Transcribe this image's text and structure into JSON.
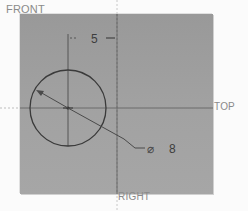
{
  "view_labels": {
    "front": "FRONT",
    "top": "TOP",
    "right": "RIGHT"
  },
  "dimensions": {
    "horizontal_offset": "5",
    "diameter_symbol": "⌀",
    "diameter_value": "8"
  },
  "sketch": {
    "circle": {
      "center_x": 68,
      "center_y": 108,
      "radius": 38
    },
    "plane_color": "#a0a0a0",
    "line_color": "#3a3a3a"
  }
}
